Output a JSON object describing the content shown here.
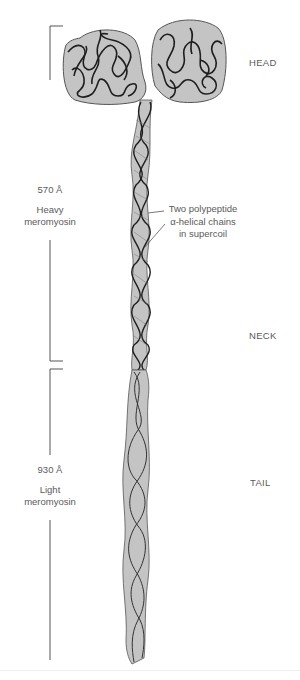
{
  "figure": {
    "regions": {
      "head": "HEAD",
      "neck": "NECK",
      "tail": "TAIL"
    },
    "segments": [
      {
        "length": "570 Å",
        "name_line1": "Heavy",
        "name_line2": "meromyosin"
      },
      {
        "length": "930 Å",
        "name_line1": "Light",
        "name_line2": "meromyosin"
      }
    ],
    "callout": {
      "line1": "Two polypeptide",
      "line2": "α-helical chains",
      "line3": "in supercoil"
    },
    "colors": {
      "protein_fill": "#c4c4c4",
      "chain_stroke": "#1e1e1e",
      "bracket": "#555555",
      "text": "#5a5a5a"
    }
  }
}
